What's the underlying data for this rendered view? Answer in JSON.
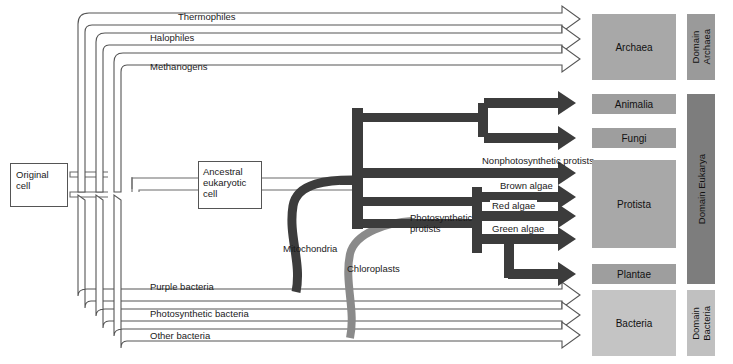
{
  "diagram": {
    "type": "phylogenetic-tree"
  },
  "origin": {
    "label": "Original\ncell",
    "line1": "Original",
    "line2": "cell"
  },
  "ancestral": {
    "line1": "Ancestral",
    "line2": "eukaryotic",
    "line3": "cell"
  },
  "archaea_branches": [
    {
      "label": "Thermophiles"
    },
    {
      "label": "Halophiles"
    },
    {
      "label": "Methanogens"
    }
  ],
  "eukarya_branches": [
    {
      "label": "Nonphotosynthetic protists"
    },
    {
      "label": "Brown algae"
    },
    {
      "label": "Red algae"
    },
    {
      "label": "Green algae"
    }
  ],
  "bacteria_branches": [
    {
      "label": "Purple bacteria"
    },
    {
      "label": "Photosynthetic bacteria"
    },
    {
      "label": "Other bacteria"
    }
  ],
  "endosymbiont_labels": [
    {
      "label": "Mitochondria"
    },
    {
      "label": "Chloroplasts"
    }
  ],
  "photosynthetic_protists": {
    "line1": "Photosynthetic",
    "line2": "protists"
  },
  "kingdoms": [
    {
      "label": "Archaea",
      "color": "#a8a8a8"
    },
    {
      "label": "Animalia",
      "color": "#9e9e9e"
    },
    {
      "label": "Fungi",
      "color": "#9e9e9e"
    },
    {
      "label": "Protista",
      "color": "#a8a8a8"
    },
    {
      "label": "Plantae",
      "color": "#9e9e9e"
    },
    {
      "label": "Bacteria",
      "color": "#c4c4c4"
    }
  ],
  "domains": [
    {
      "line1": "Domain",
      "line2": "Archaea",
      "label": "Domain Archaea",
      "color": "#9a9a9a"
    },
    {
      "line1": "Domain",
      "line2": "Eukarya",
      "label": "Domain Eukarya",
      "color": "#7d7d7d"
    },
    {
      "line1": "Domain",
      "line2": "Bacteria",
      "label": "Domain Bacteria",
      "color": "#c0c0c0"
    }
  ],
  "colors": {
    "line": "#6b6b6b",
    "dark_branch": "#3c3c3c",
    "chloroplast": "#8a8a8a",
    "mitochondria": "#3c3c3c",
    "arrow_outline": "#555555",
    "arrow_fill": "#ffffff",
    "background": "#ffffff"
  }
}
